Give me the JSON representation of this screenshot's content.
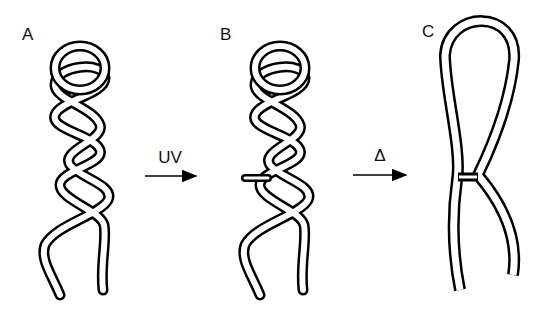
{
  "panels": [
    {
      "id": "A",
      "label": "A",
      "description": "double-stranded twisted tube, no crosslink"
    },
    {
      "id": "B",
      "label": "B",
      "description": "twisted tube with UV-induced crosslink bridge"
    },
    {
      "id": "C",
      "label": "C",
      "description": "relaxed loop retaining crosslink junction after heating"
    }
  ],
  "steps": [
    {
      "from": "A",
      "to": "B",
      "label": "UV"
    },
    {
      "from": "B",
      "to": "C",
      "label": "Δ"
    }
  ],
  "colors": {
    "stroke": "#000000",
    "fill": "#ffffff"
  }
}
